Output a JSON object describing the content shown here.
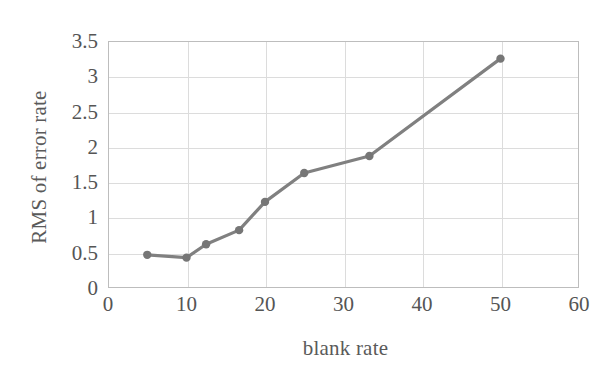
{
  "chart_data": {
    "type": "line",
    "title": "",
    "xlabel": "blank rate",
    "ylabel": "RMS of error rate",
    "xlim": [
      0,
      60
    ],
    "ylim": [
      0,
      3.5
    ],
    "grid": true,
    "legend": "none",
    "xticks": [
      0,
      10,
      20,
      30,
      40,
      50,
      60
    ],
    "xtick_labels": [
      "0",
      "10",
      "20",
      "30",
      "40",
      "50",
      "60"
    ],
    "yticks": [
      0,
      0.5,
      1,
      1.5,
      2,
      2.5,
      3,
      3.5
    ],
    "ytick_labels": [
      "0",
      "0.5",
      "1",
      "1.5",
      "2",
      "2.5",
      "3",
      "3.5"
    ],
    "series": [
      {
        "name": "RMS of error rate",
        "color": "#808080",
        "marker": "circle",
        "x": [
          5,
          10,
          12.5,
          16.7,
          20,
          25,
          33.3,
          50
        ],
        "y": [
          0.47,
          0.43,
          0.62,
          0.82,
          1.22,
          1.63,
          1.87,
          3.25
        ]
      }
    ]
  },
  "style": {
    "line_color": "#808080",
    "marker_color": "#767676",
    "grid_color": "#dcdcdc",
    "frame_color": "#bdbdbd",
    "text_color": "#555555",
    "background": "#ffffff"
  }
}
